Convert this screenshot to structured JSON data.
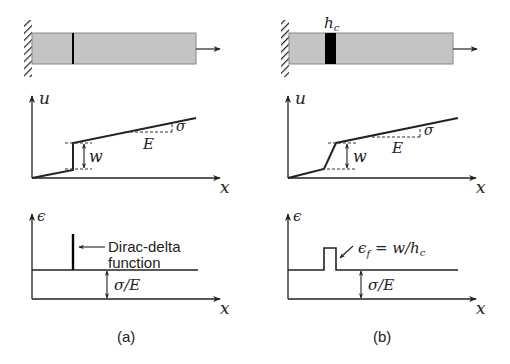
{
  "colors": {
    "bar_fill": "#c4c4c4",
    "bar_stroke": "#888888",
    "line": "#222222",
    "crack_band": "#000000",
    "background": "#ffffff"
  },
  "panel_a": {
    "caption": "(a)",
    "bar": {
      "description": "bar fixed to wall with sharp crack line, pulled to the right"
    },
    "u_plot": {
      "y_label": "u",
      "x_label": "x",
      "jump_label": "w",
      "slope_rise_label": "σ",
      "slope_run_label": "E"
    },
    "eps_plot": {
      "y_label": "ϵ",
      "x_label": "x",
      "annotation_line1": "Dirac-delta",
      "annotation_line2": "function",
      "baseline_label": "σ/E"
    }
  },
  "panel_b": {
    "caption": "(b)",
    "bar": {
      "description": "bar fixed to wall with finite-width crack band, pulled to the right",
      "band_label_base": "h",
      "band_label_sub": "c"
    },
    "u_plot": {
      "y_label": "u",
      "x_label": "x",
      "jump_label": "w",
      "slope_rise_label": "σ",
      "slope_run_label": "E"
    },
    "eps_plot": {
      "y_label": "ϵ",
      "x_label": "x",
      "annotation_eps": "ϵ",
      "annotation_eps_sub": "f",
      "annotation_rest": " = w/h",
      "annotation_rest_sub": "c",
      "baseline_label": "σ/E"
    }
  }
}
